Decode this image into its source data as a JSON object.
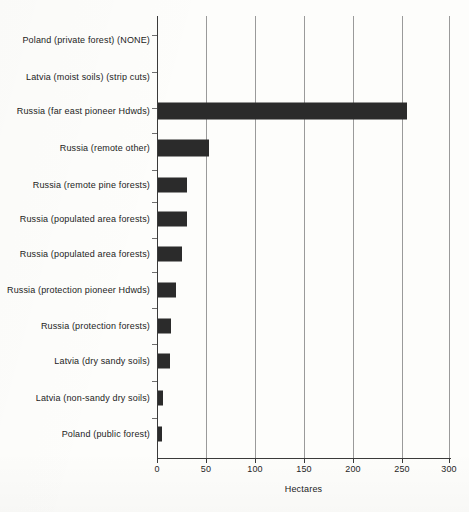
{
  "chart_data": {
    "type": "bar",
    "orientation": "horizontal",
    "title": "",
    "xlabel": "Hectares",
    "ylabel": "",
    "xlim": [
      0,
      300
    ],
    "xticks": [
      0,
      50,
      100,
      150,
      200,
      250,
      300
    ],
    "xtick_labels": [
      "0",
      "50",
      "100",
      "150",
      "200",
      "250",
      "300"
    ],
    "grid": true,
    "legend": false,
    "categories": [
      "Poland (private forest) (NONE)",
      "Latvia (moist soils) (strip cuts)",
      "Russia (far east pioneer Hdwds)",
      "Russia (remote other)",
      "Russia (remote pine forests)",
      "Russia (populated area forests)",
      "Russia (populated area forests)",
      "Russia (protection pioneer Hdwds)",
      "Russia (protection forests)",
      "Latvia (dry sandy soils)",
      "Latvia (non-sandy dry soils)",
      "Poland (public forest)"
    ],
    "values": [
      0,
      0,
      255,
      52,
      30,
      30,
      25,
      18,
      13,
      12,
      5,
      4
    ],
    "bar_color": "#2b2b2b",
    "gridline_color": "#9a9a9a",
    "axis_color": "#3a3a3a",
    "background_color": "#fdfdfb"
  }
}
